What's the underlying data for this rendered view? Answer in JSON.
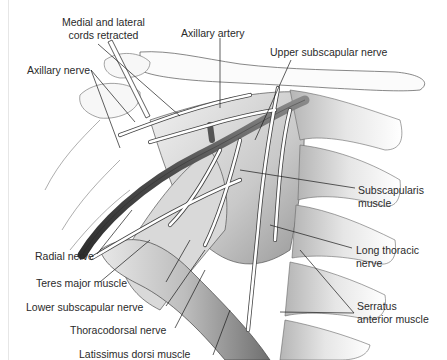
{
  "figure": {
    "colors": {
      "artery": "#555555",
      "nerve_fill": "#ffffff",
      "outline": "#444444",
      "muscle_shade": "#cfcfcf",
      "leader": "#1a1a1a"
    }
  },
  "labels": {
    "medial_lateral_cords_line1": "Medial and lateral",
    "medial_lateral_cords_line2": "cords retracted",
    "axillary_artery": "Axillary artery",
    "axillary_nerve": "Axillary nerve",
    "upper_subscapular_nerve": "Upper subscapular nerve",
    "radial_nerve": "Radial nerve",
    "subscapularis_line1": "Subscapularis",
    "subscapularis_line2": "muscle",
    "teres_major": "Teres major muscle",
    "long_thoracic_line1": "Long thoracic",
    "long_thoracic_line2": "nerve",
    "lower_subscapular_nerve": "Lower subscapular nerve",
    "thoracodorsal_nerve": "Thoracodorsal nerve",
    "serratus_line1": "Serratus",
    "serratus_line2": "anterior muscle",
    "latissimus_dorsi": "Latissimus dorsi muscle"
  }
}
